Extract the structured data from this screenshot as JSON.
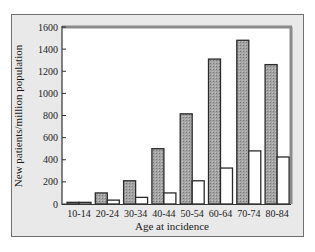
{
  "chart_data": {
    "type": "bar",
    "title": "",
    "xlabel": "Age at incidence",
    "ylabel": "New patients/million population",
    "ylim": [
      0,
      1600
    ],
    "yticks": [
      0,
      200,
      400,
      600,
      800,
      1000,
      1200,
      1400,
      1600
    ],
    "categories": [
      "10-14",
      "20-24",
      "30-34",
      "40-44",
      "50-54",
      "60-64",
      "70-74",
      "80-84"
    ],
    "series": [
      {
        "name": "Series A (shaded)",
        "color": "#9a9a9a",
        "values": [
          15,
          100,
          210,
          500,
          815,
          1310,
          1480,
          1260
        ]
      },
      {
        "name": "Series B (open)",
        "color": "#ffffff",
        "values": [
          15,
          35,
          60,
          100,
          210,
          325,
          480,
          425
        ]
      }
    ],
    "grid": false,
    "legend": "none"
  }
}
